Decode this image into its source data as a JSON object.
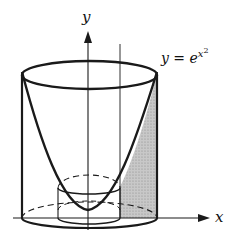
{
  "diagram": {
    "type": "solid-of-revolution",
    "axis_labels": {
      "x": "x",
      "y": "y"
    },
    "curve_label": {
      "lhs": "y = e",
      "exponent_base": "x",
      "exponent_power": "2"
    },
    "colors": {
      "stroke": "#1a1a1a",
      "shade": "#bdbdbd",
      "background": "#ffffff"
    }
  }
}
